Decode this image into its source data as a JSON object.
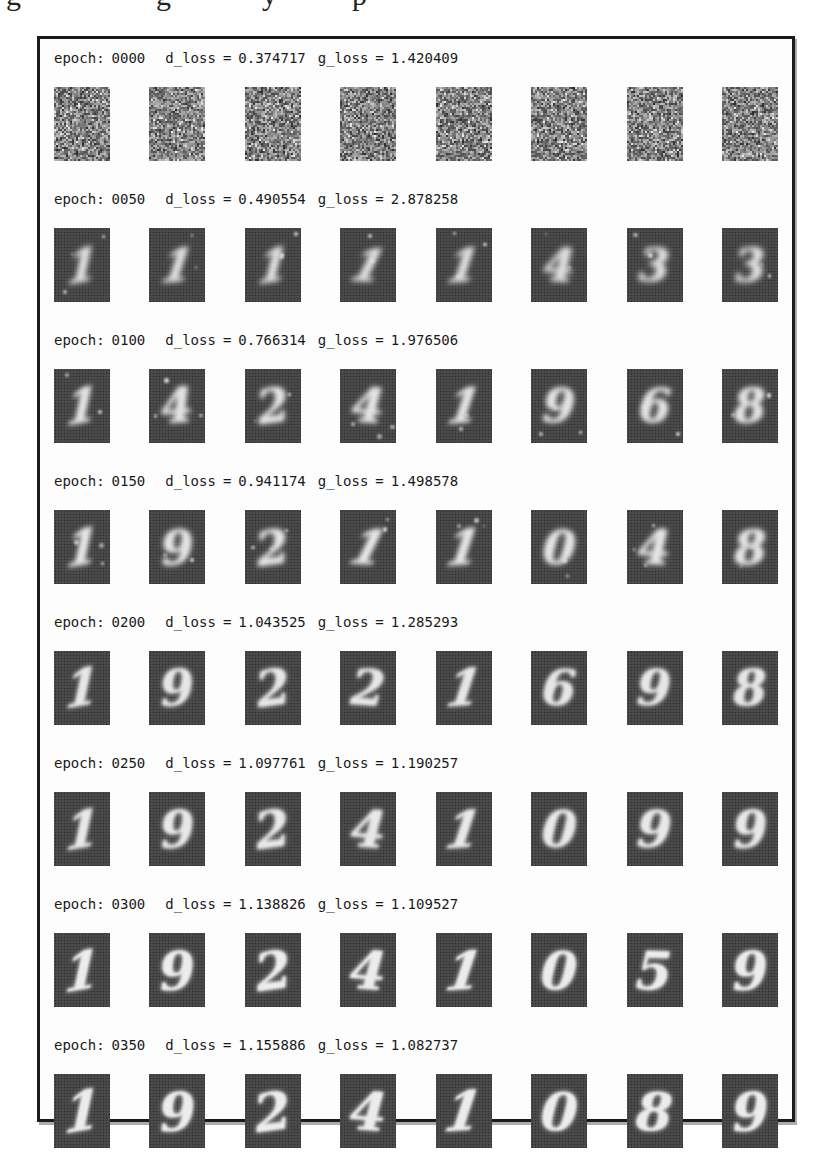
{
  "figure": {
    "cropped_caption_fragment_letters": [
      "g",
      "g",
      "y",
      "p"
    ],
    "labels": {
      "epoch": "epoch:",
      "d_loss": "d_loss",
      "g_loss": "g_loss",
      "equals": "="
    },
    "colors": {
      "page_bg": "#ffffff",
      "frame_border": "#1b1b1b",
      "header_text": "#1a1a1a",
      "tile_bg": "#474747",
      "digit": "#ececec"
    },
    "rows": [
      {
        "epoch": "0000",
        "d_loss": "0.374717",
        "g_loss": "1.420409",
        "type": "noise",
        "digits": [
          "",
          "",
          "",
          "",
          "",
          "",
          "",
          ""
        ]
      },
      {
        "epoch": "0050",
        "d_loss": "0.490554",
        "g_loss": "2.878258",
        "type": "digits",
        "digits": [
          "1",
          "1",
          "1",
          "1",
          "1",
          "4",
          "3",
          "3"
        ]
      },
      {
        "epoch": "0100",
        "d_loss": "0.766314",
        "g_loss": "1.976506",
        "type": "digits",
        "digits": [
          "1",
          "4",
          "2",
          "4",
          "1",
          "9",
          "6",
          "8"
        ]
      },
      {
        "epoch": "0150",
        "d_loss": "0.941174",
        "g_loss": "1.498578",
        "type": "digits",
        "digits": [
          "1",
          "9",
          "2",
          "1",
          "1",
          "0",
          "4",
          "8"
        ]
      },
      {
        "epoch": "0200",
        "d_loss": "1.043525",
        "g_loss": "1.285293",
        "type": "digits",
        "digits": [
          "1",
          "9",
          "2",
          "2",
          "1",
          "6",
          "9",
          "8"
        ]
      },
      {
        "epoch": "0250",
        "d_loss": "1.097761",
        "g_loss": "1.190257",
        "type": "digits",
        "digits": [
          "1",
          "9",
          "2",
          "4",
          "1",
          "0",
          "9",
          "9"
        ]
      },
      {
        "epoch": "0300",
        "d_loss": "1.138826",
        "g_loss": "1.109527",
        "type": "digits",
        "digits": [
          "1",
          "9",
          "2",
          "4",
          "1",
          "0",
          "5",
          "9"
        ]
      },
      {
        "epoch": "0350",
        "d_loss": "1.155886",
        "g_loss": "1.082737",
        "type": "digits",
        "digits": [
          "1",
          "9",
          "2",
          "4",
          "1",
          "0",
          "8",
          "9"
        ]
      }
    ]
  }
}
